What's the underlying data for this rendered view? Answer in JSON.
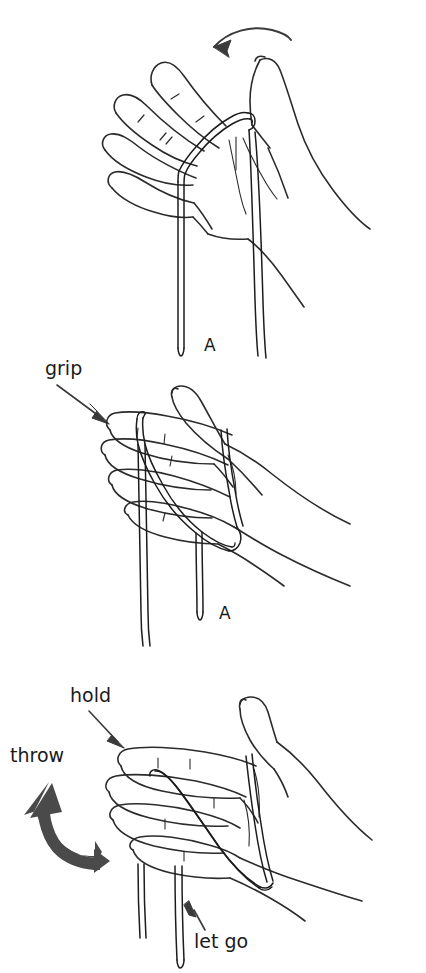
{
  "figure": {
    "type": "instructional-line-drawing",
    "background_color": "#ffffff",
    "ink_color": "#2b2b2b",
    "arrow_fill_color": "#4a4a4a",
    "width": 426,
    "height": 973
  },
  "panels": [
    {
      "id": "panel-a",
      "order": 1,
      "caption": "A",
      "caption_position": {
        "x": 207,
        "y": 349
      },
      "description": "Open hand, palm toward viewer, cord looped over the base of the thumb with two free ends hanging down",
      "annotations": [
        {
          "name": "curved-arrow-wrap",
          "kind": "arrow",
          "style": "thin-curved",
          "direction": "down-left",
          "meaning": "wrap the cord over the thumb"
        }
      ]
    },
    {
      "id": "panel-b",
      "order": 2,
      "caption": "A",
      "caption_position": {
        "x": 223,
        "y": 617
      },
      "description": "Hand rotated, fingers curled over the cord which crosses the palm; two cord ends hang below",
      "annotations": [
        {
          "name": "grip-label",
          "kind": "label-with-arrow",
          "label": "grip",
          "label_position": {
            "x": 47,
            "y": 368
          },
          "arrow_direction": "down-right",
          "meaning": "grip the cord here with the fingers"
        }
      ]
    },
    {
      "id": "panel-c",
      "order": 3,
      "caption": "",
      "description": "Closed fist seen from the side, cord wound across the knuckles, two ends hanging below",
      "annotations": [
        {
          "name": "hold-label",
          "kind": "label-with-arrow",
          "label": "hold",
          "label_position": {
            "x": 72,
            "y": 700
          },
          "arrow_direction": "down-right",
          "meaning": "hold this part with the fist"
        },
        {
          "name": "throw-label",
          "kind": "label-with-arrow",
          "label": "throw",
          "label_position": {
            "x": 12,
            "y": 761
          },
          "arrow_direction": "up-left",
          "arrow_style": "thick-curved",
          "meaning": "throw the hand up and to the left"
        },
        {
          "name": "let-go-label",
          "kind": "label-with-arrow",
          "label": "let go",
          "label_position": {
            "x": 196,
            "y": 944
          },
          "arrow_direction": "up-left",
          "meaning": "release this cord end"
        }
      ]
    }
  ],
  "labels": {
    "grip": "grip",
    "hold": "hold",
    "throw": "throw",
    "let_go": "let go",
    "marker_a_1": "A",
    "marker_a_2": "A"
  },
  "label_font_sizes": {
    "word": 19,
    "marker": 17
  }
}
